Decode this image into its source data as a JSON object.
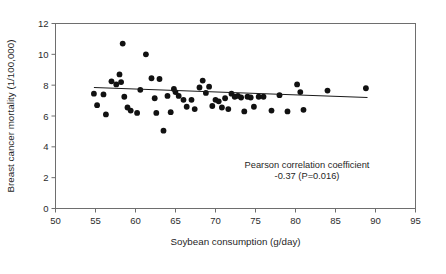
{
  "figure": {
    "background": "#ffffff",
    "point_color": "#111111",
    "axis_color": "#6e6e6e",
    "trendline_color": "#1a1a1a"
  },
  "annotations": {
    "line1": "Pearson correlation coefficient",
    "line2": "-0.37 (P=0.016)"
  },
  "chart_data": {
    "type": "scatter",
    "title": "",
    "xlabel": "Soybean consumption (g/day)",
    "ylabel": "Breast cancer mortality (1/100,000)",
    "xlim": [
      50,
      95
    ],
    "ylim": [
      0,
      12
    ],
    "xticks": [
      50,
      55,
      60,
      65,
      70,
      75,
      80,
      85,
      90,
      95
    ],
    "xtick_labels": [
      "50",
      "55",
      "60",
      "65",
      "70",
      "75",
      "80",
      "85",
      "90",
      "95"
    ],
    "yticks": [
      0,
      2,
      4,
      6,
      8,
      10,
      12
    ],
    "ytick_labels": [
      "0",
      "2",
      "4",
      "6",
      "8",
      "10",
      "12"
    ],
    "grid": false,
    "legend": false,
    "pearson_r": -0.37,
    "p_value": 0.016,
    "trendline": {
      "x_start": 54.8,
      "y_start": 7.85,
      "x_end": 89.0,
      "y_end": 7.2
    },
    "x": [
      54.8,
      55.2,
      56.0,
      56.3,
      57.0,
      57.6,
      58.0,
      58.2,
      58.4,
      58.6,
      59.0,
      59.4,
      60.2,
      60.6,
      61.3,
      62.0,
      62.4,
      62.6,
      63.0,
      63.5,
      64.0,
      64.4,
      64.8,
      65.0,
      65.4,
      66.0,
      66.4,
      67.0,
      67.4,
      68.0,
      68.4,
      68.8,
      69.2,
      69.6,
      70.0,
      70.4,
      70.8,
      71.2,
      71.6,
      72.0,
      72.4,
      72.8,
      73.2,
      73.6,
      74.0,
      74.4,
      74.8,
      75.4,
      76.0,
      77.0,
      78.0,
      79.0,
      80.2,
      80.6,
      81.0,
      84.0,
      88.8
    ],
    "y": [
      7.45,
      6.7,
      7.4,
      6.1,
      8.25,
      8.05,
      8.7,
      8.2,
      10.7,
      7.25,
      6.55,
      6.35,
      6.2,
      7.7,
      10.0,
      8.45,
      7.15,
      6.2,
      8.4,
      5.05,
      7.3,
      6.25,
      7.75,
      7.55,
      7.3,
      7.05,
      6.6,
      7.05,
      6.45,
      7.85,
      8.3,
      7.5,
      7.9,
      6.65,
      7.05,
      6.95,
      6.55,
      7.15,
      6.45,
      7.45,
      7.25,
      7.3,
      7.2,
      6.3,
      7.25,
      7.2,
      6.6,
      7.25,
      7.25,
      6.35,
      7.35,
      6.3,
      8.05,
      7.55,
      6.4,
      7.65,
      7.8
    ]
  }
}
